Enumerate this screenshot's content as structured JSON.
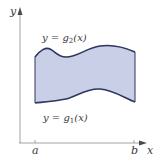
{
  "diagram": {
    "type": "region-between-curves",
    "axes": {
      "x_label": "x",
      "y_label": "y",
      "x_ticks": [
        {
          "label": "a"
        },
        {
          "label": "b"
        }
      ]
    },
    "curves": {
      "upper": {
        "label_prefix": "y = g",
        "subscript": "2",
        "label_suffix": "(x)"
      },
      "lower": {
        "label_prefix": "y = g",
        "subscript": "1",
        "label_suffix": "(x)"
      }
    },
    "colors": {
      "fill": "#c9cfe6",
      "curve": "#2e3560",
      "axis": "#8a8a8a",
      "text": "#3a3a3a"
    }
  }
}
